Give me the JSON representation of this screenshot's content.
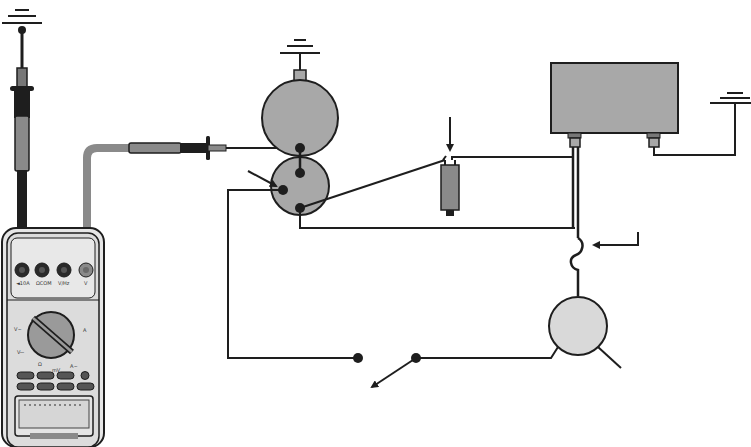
{
  "diagram": {
    "colors": {
      "wire": "#1e1e1e",
      "component_fill": "#a8a8a8",
      "motor_fill": "#d9d9d9",
      "meter_body": "#e2e2e2",
      "meter_lead_red": "#8a8a8a",
      "meter_lead_black": "#1e1e1e"
    },
    "multimeter": {
      "jacks": [
        "10A",
        "mA",
        "COM",
        "V"
      ],
      "jack_labels": [
        "◄10A",
        "ΩCOM",
        "V/Hz",
        "V"
      ],
      "dial_labels": [
        "V~",
        "V⎓",
        "Ω",
        "mV",
        "A",
        "A~"
      ],
      "buttons_rows": 2,
      "buttons_per_row": 4,
      "display_text": "",
      "brand_text": "DIGITAL MULTIMETER"
    },
    "components": [
      {
        "id": "ground-top-left",
        "type": "ground",
        "label": ""
      },
      {
        "id": "ground-device",
        "type": "ground",
        "label": ""
      },
      {
        "id": "ground-right",
        "type": "ground",
        "label": ""
      },
      {
        "id": "large-circle",
        "type": "component",
        "label": ""
      },
      {
        "id": "small-circle",
        "type": "component",
        "label": ""
      },
      {
        "id": "inline-fuse",
        "type": "connector",
        "label": ""
      },
      {
        "id": "control-module",
        "type": "box",
        "label": ""
      },
      {
        "id": "motor",
        "type": "motor",
        "label": ""
      },
      {
        "id": "switch",
        "type": "switch",
        "label": ""
      }
    ],
    "arrows": [
      {
        "id": "arrow-small-circle",
        "points_to": "small circle terminal"
      },
      {
        "id": "arrow-fuse",
        "points_to": "inline connector"
      },
      {
        "id": "arrow-wire-loop",
        "points_to": "wire loop"
      },
      {
        "id": "arrow-switch",
        "points_to": "switch contact"
      }
    ]
  }
}
